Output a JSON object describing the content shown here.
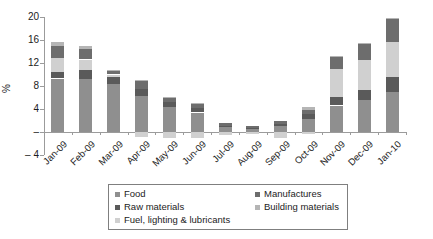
{
  "chart_data": {
    "type": "bar",
    "stacked": true,
    "title": "",
    "xlabel": "",
    "ylabel": "%",
    "ylim": [
      -4,
      20
    ],
    "ytick_values": [
      20,
      16,
      12,
      8,
      4,
      0,
      -4
    ],
    "ytick_labels": [
      "20",
      "16",
      "12",
      "8",
      "4",
      "–",
      "– 4"
    ],
    "grid": false,
    "legend_position": "bottom-boxed",
    "categories": [
      "Jan-09",
      "Feb-09",
      "Mar-09",
      "Apr-09",
      "May-09",
      "Jun-09",
      "Jul-09",
      "Aug-09",
      "Sep-09",
      "Oct-09",
      "Nov-09",
      "Dec-09",
      "Jan-10"
    ],
    "series": [
      {
        "name": "Food",
        "color": "#8f8f8f",
        "values": [
          9.3,
          9.2,
          8.4,
          6.2,
          4.3,
          3.4,
          0.8,
          0.5,
          1.0,
          2.2,
          4.6,
          5.5,
          7.0
        ]
      },
      {
        "name": "Raw materials",
        "color": "#5a5a5a",
        "values": [
          1.2,
          1.6,
          1.2,
          1.2,
          0.9,
          0.7,
          0.3,
          0.2,
          0.4,
          0.9,
          1.5,
          1.8,
          2.6
        ]
      },
      {
        "name": "Fuel, lighting & lubricants",
        "color": "#d0d0d0",
        "values": [
          2.4,
          1.8,
          0.4,
          -0.8,
          -1.0,
          -1.0,
          -0.5,
          -0.3,
          -1.0,
          -0.3,
          4.9,
          5.3,
          6.0
        ]
      },
      {
        "name": "Manufactures",
        "color": "#6d6d6d",
        "values": [
          2.0,
          1.9,
          0.6,
          1.4,
          0.8,
          0.8,
          0.4,
          0.3,
          0.6,
          0.8,
          2.1,
          2.8,
          4.0
        ]
      },
      {
        "name": "Building materials",
        "color": "#b5b5b5",
        "values": [
          0.8,
          0.5,
          0.2,
          0.2,
          0.1,
          0.1,
          0.0,
          0.0,
          0.0,
          0.5,
          0.1,
          0.1,
          0.2
        ]
      }
    ],
    "legend": {
      "left_column": [
        "Food",
        "Raw materials",
        "Fuel, lighting & lubricants"
      ],
      "right_column": [
        "Manufactures",
        "Building materials"
      ]
    }
  }
}
